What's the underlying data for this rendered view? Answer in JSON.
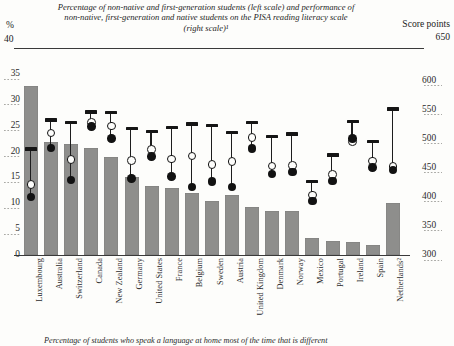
{
  "header": {
    "title": "Percentage of non-native and first-generation students (left scale) and performance of non-native, first-generation and native students on the PISA reading literacy scale (right scale)¹",
    "left_unit": "%",
    "left_top_value": "40",
    "right_unit": "Score points",
    "right_top_value": "650"
  },
  "footnote": "Percentage of students who speak a language at home most of the time that is different",
  "axes": {
    "left_ticks": [
      "35",
      "30",
      "25",
      "20",
      "15",
      "10",
      "5",
      "0"
    ],
    "right_ticks": [
      "600",
      "550",
      "500",
      "450",
      "400",
      "350",
      "300"
    ],
    "left_range": [
      0,
      40
    ],
    "right_range": [
      300,
      650
    ]
  },
  "colors": {
    "bar": "#8e8e8c",
    "marker_dark": "#121212",
    "marker_open_fill": "#fdfdfb",
    "axis": "#3a3a3a"
  },
  "chart_data": {
    "type": "bar",
    "title": "Percentage of non-native and first-generation students (left scale) and performance of non-native, first-generation and native students on the PISA reading literacy scale (right scale)",
    "xlabel": "",
    "ylabel": "%",
    "ylabel_right": "Score points",
    "ylim": [
      0,
      40
    ],
    "ylim_right": [
      300,
      650
    ],
    "grid": "dotted-minor",
    "legend": "none",
    "categories": [
      "Luxembourg",
      "Australia",
      "Switzerland",
      "Canada",
      "New Zealand",
      "Germany",
      "United States",
      "France",
      "Belgium",
      "Sweden",
      "Austria",
      "United Kingdom",
      "Denmark",
      "Norway",
      "Mexico",
      "Portugal",
      "Ireland",
      "Spain",
      "Netherlands²"
    ],
    "series": [
      {
        "name": "Percentage of non-native and first-generation students",
        "axis": "left",
        "unit": "%",
        "values": [
          32.7,
          21.8,
          21.5,
          20.6,
          19.0,
          15.0,
          13.3,
          13.0,
          12.0,
          10.4,
          11.6,
          9.3,
          8.6,
          8.5,
          3.2,
          2.8,
          2.6,
          1.9,
          10.0
        ]
      },
      {
        "name": "Native students (reading literacy score)",
        "axis": "right",
        "marker": "dash",
        "values": [
          482,
          532,
          528,
          546,
          545,
          518,
          512,
          519,
          525,
          523,
          511,
          528,
          504,
          508,
          426,
          472,
          530,
          495,
          551
        ]
      },
      {
        "name": "First-generation students (reading literacy score)",
        "axis": "right",
        "marker": "open-circle",
        "values": [
          421,
          510,
          464,
          528,
          522,
          463,
          481,
          465,
          470,
          456,
          461,
          502,
          453,
          454,
          403,
          438,
          495,
          462,
          452
        ]
      },
      {
        "name": "Non-native students (reading literacy score)",
        "axis": "right",
        "marker": "filled-circle",
        "values": [
          400,
          484,
          429,
          521,
          500,
          432,
          469,
          435,
          417,
          426,
          417,
          483,
          439,
          443,
          393,
          427,
          500,
          450,
          446
        ]
      }
    ]
  }
}
